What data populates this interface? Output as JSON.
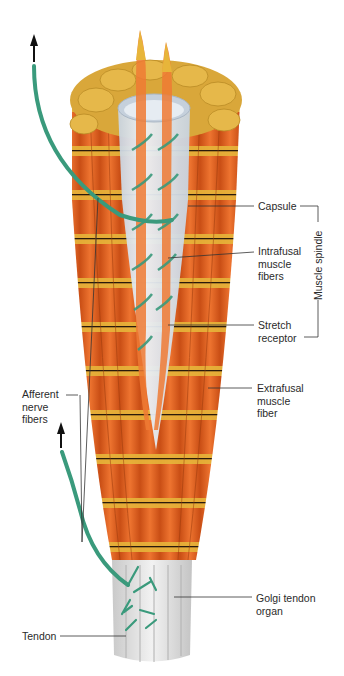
{
  "figure": {
    "colors": {
      "background": "#ffffff",
      "muscle_orange": "#e8661f",
      "muscle_orange_dark": "#c94e15",
      "muscle_band_gold": "#e7b53a",
      "end_cap_gold": "#d9a73a",
      "capsule": "#dfe6ee",
      "nerve_green": "#3a9a7c",
      "tendon": "#d9d9d9",
      "leader_line": "#333333",
      "text": "#2a2a2a"
    },
    "labels": {
      "capsule": "Capsule",
      "intrafusal": "Intrafusal\nmuscle\nfibers",
      "stretch_receptor": "Stretch\nreceptor",
      "muscle_spindle": "Muscle spindle",
      "extrafusal": "Extrafusal\nmuscle\nfiber",
      "afferent": "Afferent\nnerve\nfibers",
      "golgi": "Golgi tendon\norgan",
      "tendon": "Tendon"
    }
  }
}
